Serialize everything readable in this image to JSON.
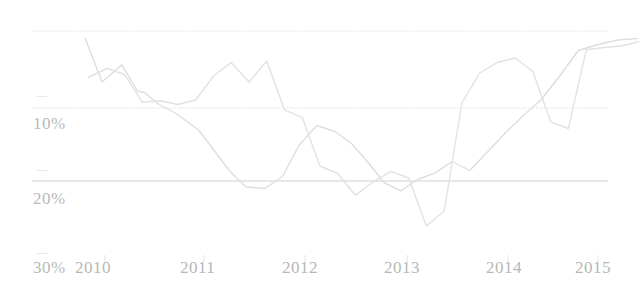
{
  "chart_data": {
    "type": "line",
    "title": "",
    "subtitle": "",
    "xlabel": "",
    "ylabel": "",
    "y_axis_inverted": true,
    "ylim": [
      0,
      30
    ],
    "y_ticks": [
      0,
      10,
      20,
      30
    ],
    "y_tick_labels": [
      "",
      "10%",
      "20%",
      "30%"
    ],
    "x_tick_labels": [
      "2010",
      "2011",
      "2012",
      "2013",
      "2014",
      "2015"
    ],
    "x_range": [
      "2010",
      "2015"
    ],
    "grid": true,
    "legend": "none",
    "series": [
      {
        "name": "series-1",
        "color": "#dedede",
        "x": [
          2009.8,
          2009.97,
          2010.17,
          2010.33,
          2010.4,
          2010.52,
          2010.55,
          2010.72,
          2010.95,
          2011.1,
          2011.26,
          2011.43,
          2011.62,
          2011.8,
          2011.97,
          2012.15,
          2012.33,
          2012.5,
          2012.66,
          2012.83,
          2013.0,
          2013.17,
          2013.35,
          2013.52,
          2013.7,
          2013.88,
          2014.06,
          2014.24,
          2014.42,
          2014.6,
          2014.8,
          2015.0,
          2015.2,
          2015.4
        ],
        "values": [
          1.0,
          6.8,
          4.5,
          8.0,
          8.2,
          9.5,
          9.8,
          11.0,
          13.2,
          15.8,
          18.6,
          20.8,
          21.0,
          19.4,
          15.2,
          12.6,
          13.4,
          15.0,
          17.4,
          20.2,
          21.3,
          19.8,
          18.9,
          17.4,
          18.6,
          16.1,
          13.6,
          11.3,
          9.2,
          6.2,
          2.6,
          1.8,
          1.2,
          1.0
        ]
      },
      {
        "name": "series-2",
        "color": "#e2e2e2",
        "x": [
          2009.83,
          2010.02,
          2010.2,
          2010.38,
          2010.56,
          2010.74,
          2010.92,
          2011.1,
          2011.28,
          2011.46,
          2011.64,
          2011.82,
          2012.0,
          2012.18,
          2012.36,
          2012.54,
          2012.72,
          2012.9,
          2013.08,
          2013.26,
          2013.44,
          2013.62,
          2013.8,
          2013.98,
          2014.16,
          2014.34,
          2014.52,
          2014.7,
          2014.88,
          2015.06,
          2015.24,
          2015.42
        ],
        "values": [
          6.2,
          5.0,
          5.8,
          9.5,
          9.3,
          9.8,
          9.2,
          6.0,
          4.2,
          6.8,
          4.0,
          10.5,
          11.5,
          18.0,
          19.0,
          21.9,
          20.1,
          18.7,
          19.6,
          26.0,
          24.0,
          9.6,
          5.6,
          4.2,
          3.6,
          5.4,
          12.1,
          13.0,
          2.5,
          2.2,
          2.0,
          1.4
        ]
      }
    ]
  },
  "axes": {
    "y_label_10": "10%",
    "y_label_20": "20%",
    "y_label_30": "30%",
    "tick_dash": "––"
  },
  "x_labels": {
    "l0": "2010",
    "l1": "2011",
    "l2": "2012",
    "l3": "2013",
    "l4": "2014",
    "l5": "2015"
  }
}
